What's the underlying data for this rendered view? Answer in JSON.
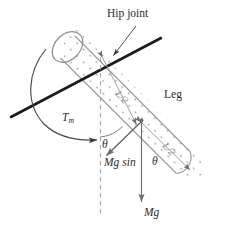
{
  "figure": {
    "type": "mechanics-free-body-diagram",
    "colors": {
      "text": "#2b2b2b",
      "gray_text": "#8a8a8a",
      "cylinder_outline": "#9a9a9a",
      "stipple": "#9a9a9a",
      "axis_line": "#1a1a1a",
      "dashed_line": "#a8a8a8",
      "vector": "#6e6e6e",
      "arc": "#4a4a4a",
      "background": "#ffffff"
    },
    "labels": {
      "hip_joint": "Hip joint",
      "leg": "Leg",
      "torque": "T",
      "torque_subscript": "m",
      "theta_axis": "θ",
      "mg_sin_theta": "Mg sin",
      "mg_sin_theta_angle": "θ",
      "mg": "Mg",
      "half_length_upper": "L/2",
      "half_length_lower": "L/2"
    },
    "elements": {
      "cylinder": "leg-cylinder",
      "hip_axis": "rotation-axis-line",
      "torque_arc": "torque-arc",
      "vertical_reference": "vertical-dashed-reference-line",
      "weight_vector": "mg-weight-vector",
      "tangential_vector": "mg-sin-theta-vector",
      "com_point": "center-of-mass-point",
      "angle_arc": "theta-angle-arc"
    }
  }
}
